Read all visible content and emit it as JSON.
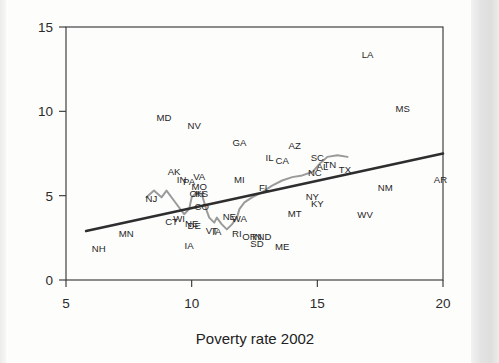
{
  "chart_data": {
    "type": "scatter",
    "title": "",
    "xlabel": "Poverty rate 2002",
    "ylabel": "",
    "xlim": [
      5,
      20
    ],
    "ylim": [
      0,
      15
    ],
    "xticks": [
      5,
      10,
      15,
      20
    ],
    "yticks": [
      0,
      5,
      10,
      15
    ],
    "grid": false,
    "legend": "none",
    "point_label_style": "state-abbreviation-text",
    "colors": {
      "trend_line": "#2e2e2e",
      "lowess_line": "#9a9a9a",
      "axis": "#3a3a3a",
      "text": "#262626",
      "background": "#fdfdfc"
    },
    "annotations": [
      {
        "label": "LA",
        "x": 17.0,
        "y": 13.3
      },
      {
        "label": "MD",
        "x": 8.9,
        "y": 9.6
      },
      {
        "label": "MS",
        "x": 18.4,
        "y": 10.1
      },
      {
        "label": "NV",
        "x": 10.1,
        "y": 9.1
      },
      {
        "label": "GA",
        "x": 11.9,
        "y": 8.1
      },
      {
        "label": "AZ",
        "x": 14.1,
        "y": 7.9
      },
      {
        "label": "IL",
        "x": 13.1,
        "y": 7.2
      },
      {
        "label": "CA",
        "x": 13.6,
        "y": 7.0
      },
      {
        "label": "SC",
        "x": 15.0,
        "y": 7.2
      },
      {
        "label": "AL",
        "x": 15.2,
        "y": 6.7
      },
      {
        "label": "TN",
        "x": 15.5,
        "y": 6.8
      },
      {
        "label": "NC",
        "x": 14.9,
        "y": 6.3
      },
      {
        "label": "TX",
        "x": 16.1,
        "y": 6.5
      },
      {
        "label": "AK",
        "x": 9.3,
        "y": 6.4
      },
      {
        "label": "IN",
        "x": 9.6,
        "y": 5.9
      },
      {
        "label": "PA",
        "x": 9.9,
        "y": 5.8
      },
      {
        "label": "VA",
        "x": 10.3,
        "y": 6.1
      },
      {
        "label": "MI",
        "x": 11.9,
        "y": 5.9
      },
      {
        "label": "MO",
        "x": 10.3,
        "y": 5.5
      },
      {
        "label": "OH",
        "x": 10.2,
        "y": 5.1
      },
      {
        "label": "KS",
        "x": 10.4,
        "y": 5.1
      },
      {
        "label": "NM",
        "x": 17.7,
        "y": 5.4
      },
      {
        "label": "AR",
        "x": 19.9,
        "y": 5.9
      },
      {
        "label": "FL",
        "x": 12.9,
        "y": 5.4
      },
      {
        "label": "NJ",
        "x": 8.4,
        "y": 4.8
      },
      {
        "label": "CO",
        "x": 10.4,
        "y": 4.3
      },
      {
        "label": "NY",
        "x": 14.8,
        "y": 4.9
      },
      {
        "label": "KY",
        "x": 15.0,
        "y": 4.5
      },
      {
        "label": "WV",
        "x": 16.9,
        "y": 3.8
      },
      {
        "label": "MT",
        "x": 14.1,
        "y": 3.9
      },
      {
        "label": "CT",
        "x": 9.2,
        "y": 3.4
      },
      {
        "label": "WI",
        "x": 9.5,
        "y": 3.6
      },
      {
        "label": "NE",
        "x": 10.0,
        "y": 3.3
      },
      {
        "label": "DE",
        "x": 10.1,
        "y": 3.2
      },
      {
        "label": "WA",
        "x": 11.9,
        "y": 3.6
      },
      {
        "label": "NE2",
        "x": 11.5,
        "y": 3.7
      },
      {
        "label": "VT",
        "x": 10.8,
        "y": 2.9
      },
      {
        "label": "IA",
        "x": 11.0,
        "y": 2.8
      },
      {
        "label": "RI",
        "x": 11.8,
        "y": 2.7
      },
      {
        "label": "OR",
        "x": 12.3,
        "y": 2.5
      },
      {
        "label": "IN2",
        "x": 12.6,
        "y": 2.5
      },
      {
        "label": "ND",
        "x": 12.9,
        "y": 2.5
      },
      {
        "label": "SD",
        "x": 12.6,
        "y": 2.1
      },
      {
        "label": "MN",
        "x": 7.4,
        "y": 2.7
      },
      {
        "label": "NH",
        "x": 6.3,
        "y": 1.8
      },
      {
        "label": "ME",
        "x": 13.6,
        "y": 1.9
      },
      {
        "label": "IA2",
        "x": 9.9,
        "y": 2.0
      }
    ],
    "trend_line": {
      "name": "linear fit",
      "x": [
        5.8,
        20.0
      ],
      "y": [
        2.9,
        7.5
      ]
    },
    "lowess_line": {
      "name": "connected path",
      "points": [
        [
          8.2,
          4.9
        ],
        [
          8.5,
          5.3
        ],
        [
          8.8,
          4.9
        ],
        [
          9.0,
          5.3
        ],
        [
          9.3,
          4.7
        ],
        [
          9.5,
          4.3
        ],
        [
          9.7,
          3.9
        ],
        [
          9.9,
          4.2
        ],
        [
          10.0,
          4.9
        ],
        [
          10.2,
          5.2
        ],
        [
          10.4,
          5.1
        ],
        [
          10.5,
          4.6
        ],
        [
          10.6,
          4.1
        ],
        [
          10.7,
          3.7
        ],
        [
          10.9,
          3.4
        ],
        [
          11.0,
          3.7
        ],
        [
          11.2,
          3.3
        ],
        [
          11.4,
          3.0
        ],
        [
          11.6,
          3.3
        ],
        [
          11.8,
          3.7
        ],
        [
          11.9,
          4.2
        ],
        [
          12.1,
          4.6
        ],
        [
          12.4,
          4.9
        ],
        [
          12.8,
          5.2
        ],
        [
          13.2,
          5.6
        ],
        [
          13.6,
          5.9
        ],
        [
          14.0,
          6.1
        ],
        [
          14.4,
          6.2
        ],
        [
          14.8,
          6.4
        ],
        [
          15.1,
          6.9
        ],
        [
          15.4,
          7.3
        ],
        [
          15.8,
          7.4
        ],
        [
          16.2,
          7.3
        ]
      ]
    }
  },
  "axes": {
    "x_tick_labels": [
      "5",
      "10",
      "15",
      "20"
    ],
    "y_tick_labels": [
      "0",
      "5",
      "10",
      "15"
    ],
    "x_axis_title": "Poverty rate 2002"
  }
}
